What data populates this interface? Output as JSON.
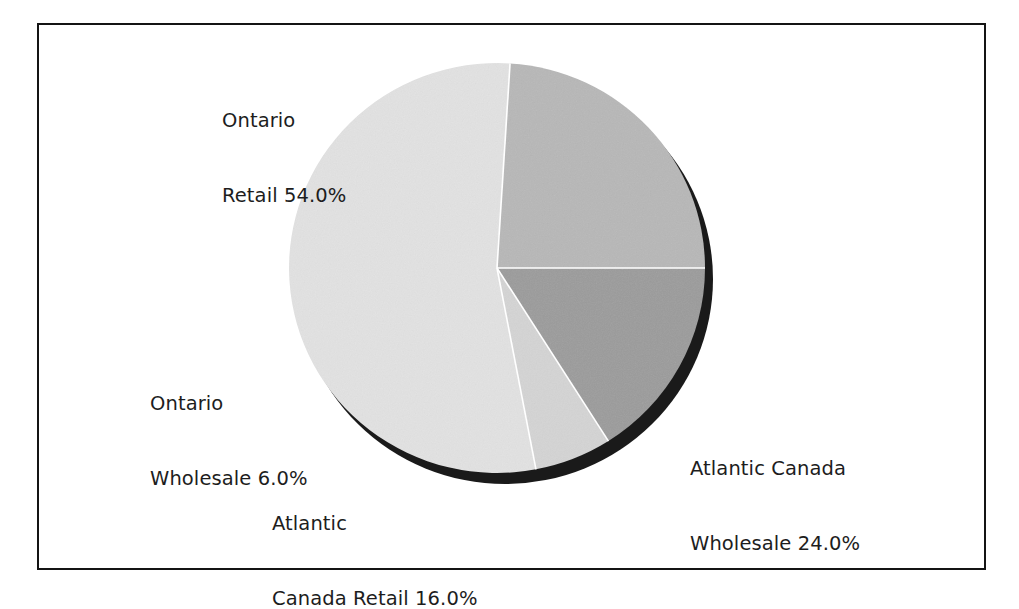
{
  "figure": {
    "background_color": "#ffffff",
    "frame_color": "#141414"
  },
  "chart_data": {
    "type": "pie",
    "title": "",
    "subtitle": "",
    "xlabel": "",
    "ylabel": "",
    "legend_position": "none",
    "grid": false,
    "labels_outside": true,
    "value_format": "percent_one_decimal",
    "three_d": true,
    "categories": [
      "Ontario Retail",
      "Ontario Wholesale",
      "Atlantic Canada Retail",
      "Atlantic Canada Wholesale"
    ],
    "values": [
      54.0,
      6.0,
      16.0,
      24.0
    ],
    "slices": [
      {
        "name": "Ontario Retail",
        "value": 54.0,
        "label_line1": "Ontario",
        "label_line2": "Retail 54.0%",
        "color": "#e2e2e2",
        "start_angle_deg": 86.4,
        "end_angle_deg": 280.8
      },
      {
        "name": "Ontario Wholesale",
        "value": 6.0,
        "label_line1": "Ontario",
        "label_line2": "Wholesale 6.0%",
        "color": "#d4d4d4",
        "start_angle_deg": 280.8,
        "end_angle_deg": 302.4
      },
      {
        "name": "Atlantic Canada Retail",
        "value": 16.0,
        "label_line1": "Atlantic",
        "label_line2": "Canada Retail 16.0%",
        "color": "#9b9b9b",
        "start_angle_deg": 302.4,
        "end_angle_deg": 360.0
      },
      {
        "name": "Atlantic Canada Wholesale",
        "value": 24.0,
        "label_line1": "Atlantic Canada",
        "label_line2": "Wholesale 24.0%",
        "color": "#b7b7b7",
        "start_angle_deg": 0.0,
        "end_angle_deg": 86.4
      }
    ],
    "geometry": {
      "center_x": 497,
      "center_y": 268,
      "radius_x": 208,
      "radius_y": 205,
      "shadow_offset_x": 8,
      "shadow_offset_y": 11,
      "shadow_color": "#1a1a1a",
      "separator_color": "#ffffff"
    }
  },
  "labels": {
    "ontario_retail": {
      "line1": "Ontario",
      "line2": "Retail 54.0%"
    },
    "ontario_wholesale": {
      "line1": "Ontario",
      "line2": "Wholesale 6.0%"
    },
    "atlantic_retail": {
      "line1": "Atlantic",
      "line2": "Canada Retail 16.0%"
    },
    "atlantic_wholesale": {
      "line1": "Atlantic Canada",
      "line2": "Wholesale 24.0%"
    }
  }
}
